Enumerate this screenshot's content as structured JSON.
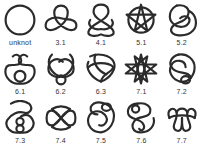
{
  "stroke_color": "#2b2b2b",
  "knots": [
    {
      "label": "unknot",
      "icon": "unknot-icon"
    },
    {
      "label": "3.1",
      "icon": "trefoil-knot-icon"
    },
    {
      "label": "4.1",
      "icon": "figure-eight-knot-icon"
    },
    {
      "label": "5.1",
      "icon": "cinquefoil-knot-icon"
    },
    {
      "label": "5.2",
      "icon": "three-twist-knot-icon"
    },
    {
      "label": "6.1",
      "icon": "stevedore-knot-icon"
    },
    {
      "label": "6.2",
      "icon": "knot-6-2-icon"
    },
    {
      "label": "6.3",
      "icon": "knot-6-3-icon"
    },
    {
      "label": "7.1",
      "icon": "septafoil-knot-icon"
    },
    {
      "label": "7.2",
      "icon": "knot-7-2-icon"
    },
    {
      "label": "7.3",
      "icon": "knot-7-3-icon"
    },
    {
      "label": "7.4",
      "icon": "knot-7-4-icon"
    },
    {
      "label": "7.5",
      "icon": "knot-7-5-icon"
    },
    {
      "label": "7.6",
      "icon": "knot-7-6-icon"
    },
    {
      "label": "7.7",
      "icon": "knot-7-7-icon"
    }
  ]
}
